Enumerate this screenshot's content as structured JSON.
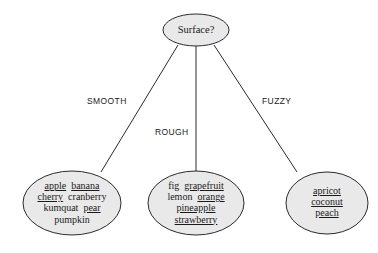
{
  "diagram": {
    "type": "decision-tree",
    "question": "Surface?",
    "colors": {
      "node_fill": "#e9e9e9",
      "node_stroke": "#2b2b2b",
      "edge_stroke": "#2b2b2b",
      "text": "#1a1a1a",
      "background": "#ffffff"
    },
    "root": {
      "label": "Surface?"
    },
    "edges": [
      {
        "label": "SMOOTH"
      },
      {
        "label": "ROUGH"
      },
      {
        "label": "FUZZY"
      }
    ],
    "leaves": [
      {
        "name": "smooth-group",
        "rows": [
          [
            {
              "text": "apple",
              "underlined": true
            },
            {
              "text": "banana",
              "underlined": true
            }
          ],
          [
            {
              "text": "cherry",
              "underlined": true
            },
            {
              "text": "cranberry",
              "underlined": false
            }
          ],
          [
            {
              "text": "kumquat",
              "underlined": false
            },
            {
              "text": "pear",
              "underlined": true
            }
          ],
          [
            {
              "text": "pumpkin",
              "underlined": false
            }
          ]
        ]
      },
      {
        "name": "rough-group",
        "rows": [
          [
            {
              "text": "fig",
              "underlined": false
            },
            {
              "text": "grapefruit",
              "underlined": true
            }
          ],
          [
            {
              "text": "lemon",
              "underlined": false
            },
            {
              "text": "orange",
              "underlined": true
            }
          ],
          [
            {
              "text": "pineapple",
              "underlined": true
            }
          ],
          [
            {
              "text": "strawberry",
              "underlined": true
            }
          ]
        ]
      },
      {
        "name": "fuzzy-group",
        "rows": [
          [
            {
              "text": "apricot",
              "underlined": true
            }
          ],
          [
            {
              "text": "coconut",
              "underlined": true
            }
          ],
          [
            {
              "text": "peach",
              "underlined": true
            }
          ]
        ]
      }
    ]
  }
}
